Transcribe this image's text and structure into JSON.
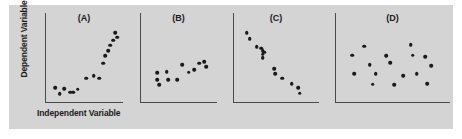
{
  "figure": {
    "background_color": "#d4d4d4",
    "axis_color": "#4a4a4a",
    "point_color": "#1a1a1a",
    "ylabel": "Dependent Variable",
    "xlabel": "Independent Variable"
  },
  "chart_data": [
    {
      "type": "scatter",
      "title": "(A)",
      "xlabel": "Independent Variable",
      "ylabel": "Dependent Variable",
      "xlim": [
        0,
        100
      ],
      "ylim": [
        0,
        100
      ],
      "grid": false,
      "legend": false,
      "relationship": "positive nonlinear / increasing",
      "x": [
        7,
        13,
        20,
        28,
        33,
        39,
        51,
        62,
        70,
        76,
        79,
        83,
        86,
        90,
        93,
        96
      ],
      "y": [
        14,
        6,
        13,
        8,
        8,
        12,
        27,
        30,
        27,
        47,
        57,
        64,
        71,
        78,
        88,
        82
      ]
    },
    {
      "type": "scatter",
      "title": "(B)",
      "xlabel": "Independent Variable",
      "ylabel": "Dependent Variable",
      "xlim": [
        0,
        100
      ],
      "ylim": [
        0,
        100
      ],
      "grid": false,
      "legend": false,
      "relationship": "weak positive",
      "x": [
        17,
        17,
        20,
        31,
        33,
        46,
        54,
        63,
        71,
        78,
        86,
        89
      ],
      "y": [
        34,
        25,
        18,
        36,
        25,
        25,
        45,
        35,
        38,
        47,
        49,
        42
      ]
    },
    {
      "type": "scatter",
      "title": "(C)",
      "xlabel": "Independent Variable",
      "ylabel": "Dependent Variable",
      "xlim": [
        0,
        100
      ],
      "ylim": [
        0,
        100
      ],
      "grid": false,
      "legend": false,
      "relationship": "negative / decreasing",
      "x": [
        10,
        14,
        23,
        29,
        31,
        31,
        31,
        33,
        46,
        47,
        56,
        69,
        77,
        79
      ],
      "y": [
        88,
        80,
        69,
        67,
        64,
        59,
        54,
        62,
        40,
        33,
        27,
        20,
        14,
        7
      ]
    },
    {
      "type": "scatter",
      "title": "(D)",
      "xlabel": "Independent Variable",
      "ylabel": "Dependent Variable",
      "xlim": [
        0,
        100
      ],
      "ylim": [
        0,
        100
      ],
      "grid": false,
      "legend": false,
      "relationship": "no correlation / random",
      "x": [
        9,
        11,
        21,
        26,
        29,
        32,
        42,
        46,
        50,
        59,
        66,
        68,
        72,
        80,
        82,
        86
      ],
      "y": [
        58,
        33,
        70,
        45,
        19,
        33,
        57,
        48,
        18,
        30,
        72,
        58,
        33,
        56,
        20,
        44
      ]
    }
  ],
  "panels": [
    {
      "id": "a",
      "label": "(A)"
    },
    {
      "id": "b",
      "label": "(B)"
    },
    {
      "id": "c",
      "label": "(C)"
    },
    {
      "id": "d",
      "label": "(D)"
    }
  ]
}
